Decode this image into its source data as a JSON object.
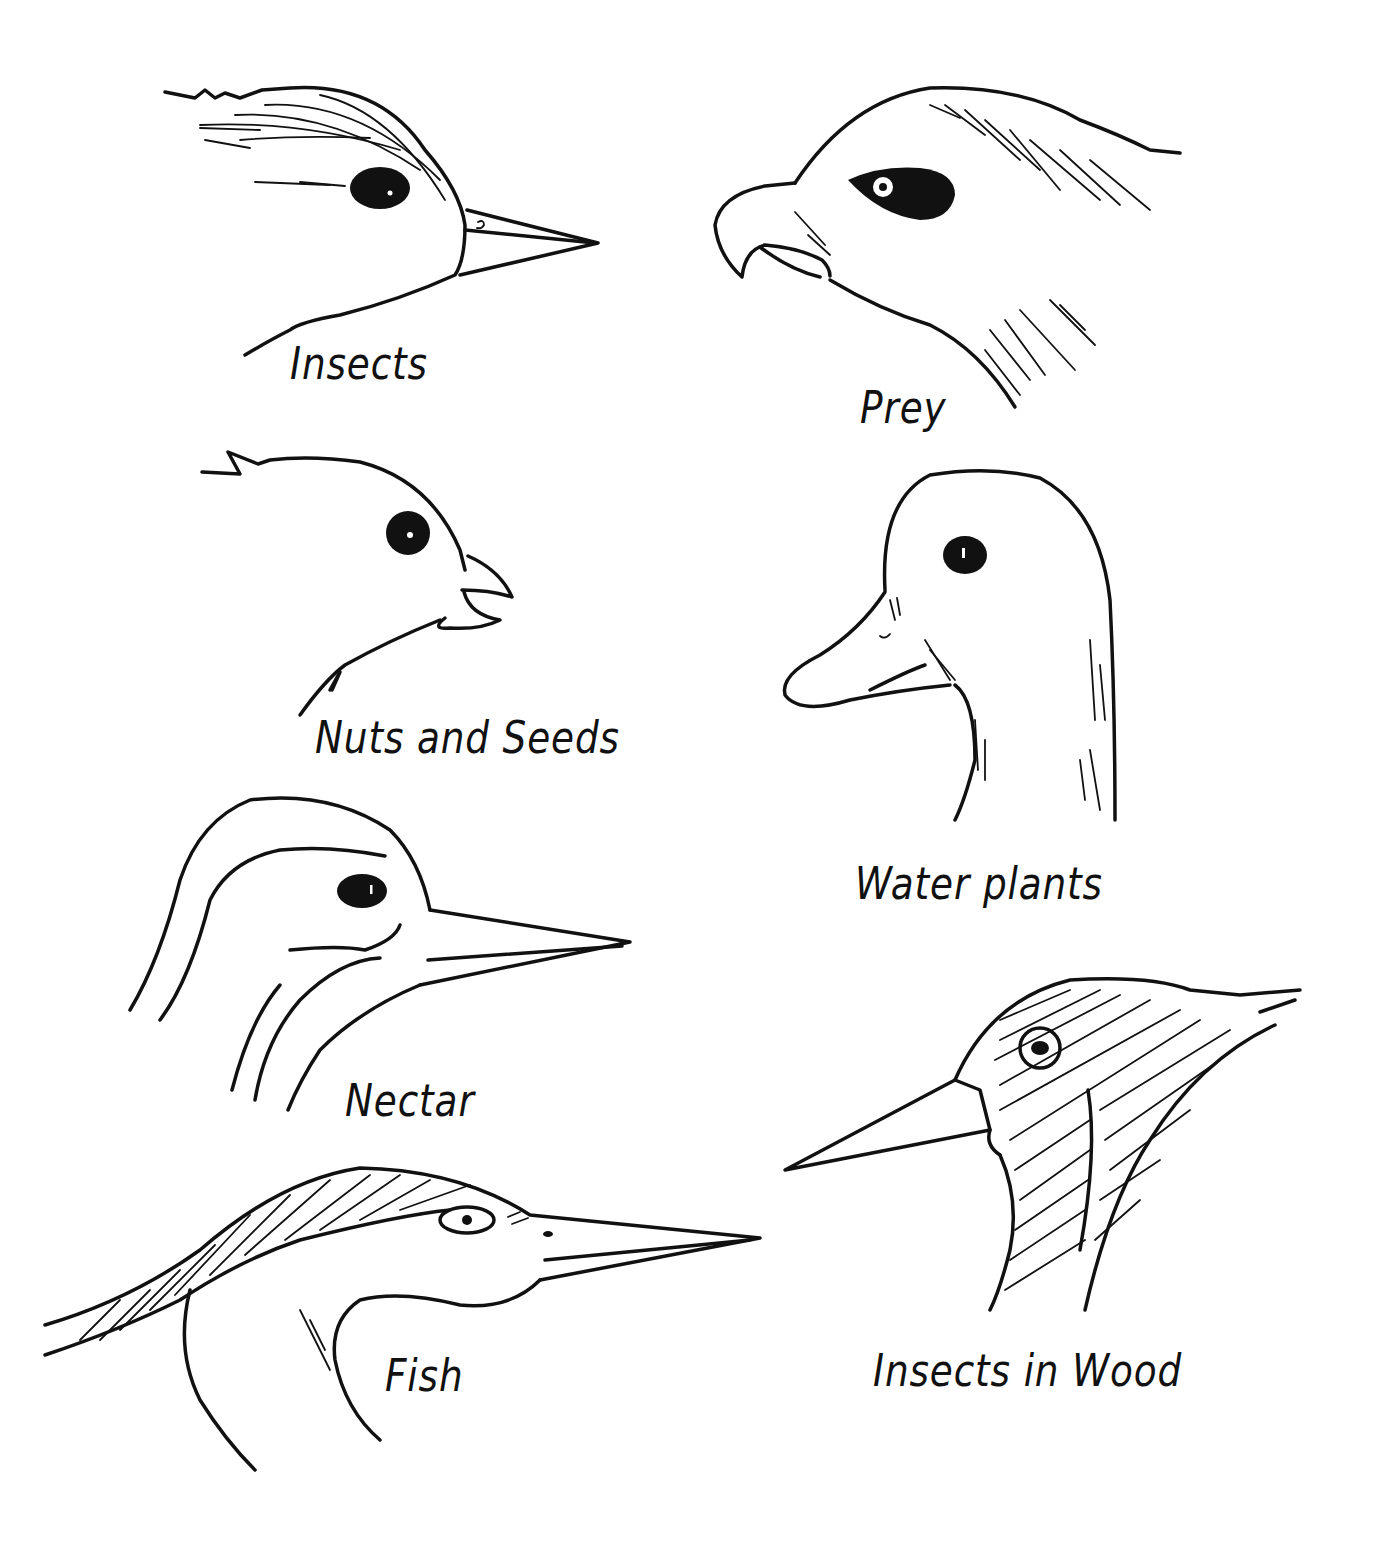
{
  "diagram": {
    "title": "",
    "background": "#ffffff",
    "ink_color": "#111111",
    "panels": [
      {
        "id": "insects",
        "label": "Insects",
        "icon": "warbler-head-icon",
        "beak": "thin pointed"
      },
      {
        "id": "prey",
        "label": "Prey",
        "icon": "hawk-head-icon",
        "beak": "hooked"
      },
      {
        "id": "nuts-seeds",
        "label": "Nuts and Seeds",
        "icon": "finch-head-icon",
        "beak": "short conical"
      },
      {
        "id": "water-plants",
        "label": "Water plants",
        "icon": "duck-head-icon",
        "beak": "flat broad bill"
      },
      {
        "id": "nectar",
        "label": "Nectar",
        "icon": "hummingbird-head-icon",
        "beak": "long slender"
      },
      {
        "id": "insects-in-wood",
        "label": "Insects in Wood",
        "icon": "woodpecker-head-icon",
        "beak": "chisel-like"
      },
      {
        "id": "fish",
        "label": "Fish",
        "icon": "heron-head-icon",
        "beak": "long spear"
      }
    ]
  }
}
